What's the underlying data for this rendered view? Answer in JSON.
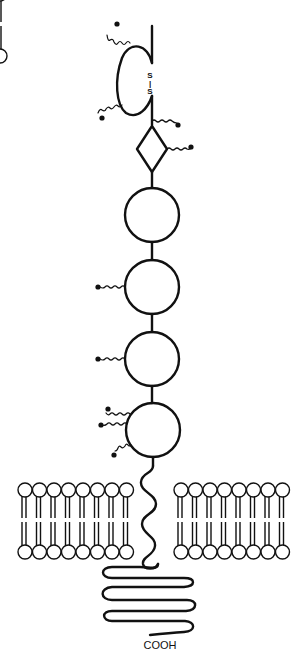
{
  "diagram": {
    "type": "membrane protein schematic",
    "stroke_color": "#111111",
    "background": "#ffffff",
    "labels": {
      "disulfide_top": "S",
      "disulfide_bond": "|",
      "disulfide_bottom": "S",
      "c_terminus": "COOH"
    },
    "extracellular_domains": [
      {
        "shape": "loop",
        "note": "disulfide-bonded loop"
      },
      {
        "shape": "diamond"
      },
      {
        "shape": "circle"
      },
      {
        "shape": "circle"
      },
      {
        "shape": "circle"
      },
      {
        "shape": "circle"
      }
    ],
    "glycosylation_sites": 10,
    "membrane": {
      "left_lipids": 8,
      "right_lipids": 8
    }
  }
}
